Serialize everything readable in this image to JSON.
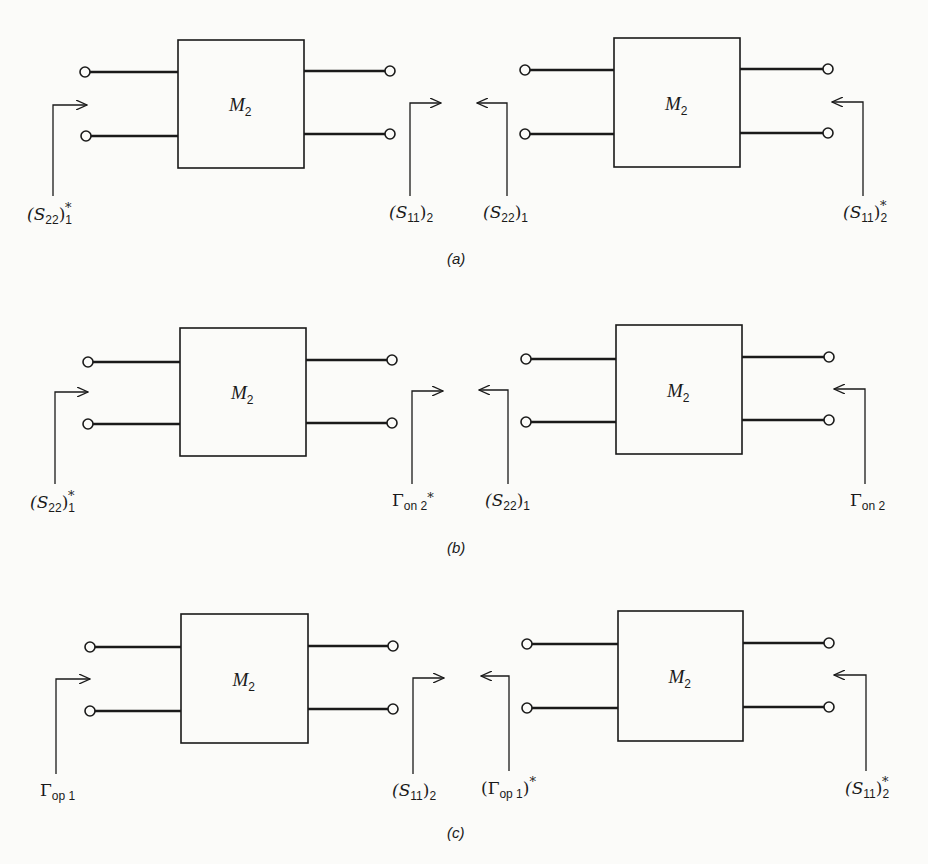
{
  "figure": {
    "panels": [
      {
        "id": "a",
        "caption": "(a)",
        "caption_pos": [
          447,
          264
        ],
        "networks": [
          {
            "block_label": "M",
            "block_sub": "2",
            "box": [
              178,
              40,
              126,
              128
            ],
            "left_terminals": [
              [
                85,
                72
              ],
              [
                86,
                136
              ]
            ],
            "right_terminals": [
              [
                390,
                71
              ],
              [
                390,
                134
              ]
            ],
            "arrow": {
              "vx": 53,
              "y_top": 105,
              "y_bot": 196,
              "tip_x": 87,
              "dir": "right"
            },
            "port_label": {
              "main": "(S",
              "sub": "22",
              "close": ")",
              "tail_sub": "1",
              "sup": "*",
              "x": 27,
              "y": 220
            }
          },
          {
            "block_label": "M",
            "block_sub": "2",
            "box": [
              614,
              38,
              126,
              129
            ],
            "left_terminals": [
              [
                525,
                70
              ],
              [
                525,
                134
              ]
            ],
            "right_terminals": [
              [
                828,
                69
              ],
              [
                828,
                133
              ]
            ],
            "arrow": {
              "vx": 507,
              "y_top": 103,
              "y_bot": 196,
              "tip_x": 477,
              "dir": "left"
            },
            "port_label": {
              "main": "(S",
              "sub": "22",
              "close": ")",
              "tail_sub": "1",
              "sup": "",
              "x": 483,
              "y": 218
            }
          }
        ],
        "mid_arrow": {
          "vx": 410,
          "y_top": 103,
          "y_bot": 196,
          "tip_x": 441,
          "dir": "right"
        },
        "mid_label": {
          "main": "(S",
          "sub": "11",
          "close": ")",
          "tail_sub": "2",
          "sup": "",
          "x": 389,
          "y": 218
        },
        "right_arrow": {
          "vx": 863,
          "y_top": 102,
          "y_bot": 196,
          "tip_x": 832,
          "dir": "left"
        },
        "right_label": {
          "main": "(S",
          "sub": "11",
          "close": ")",
          "tail_sub": "2",
          "sup": "*",
          "x": 843,
          "y": 218
        }
      },
      {
        "id": "b",
        "caption": "(b)",
        "caption_pos": [
          447,
          553
        ],
        "networks": [
          {
            "block_label": "M",
            "block_sub": "2",
            "box": [
              180,
              328,
              126,
              128
            ],
            "left_terminals": [
              [
                88,
                362
              ],
              [
                88,
                424
              ]
            ],
            "right_terminals": [
              [
                392,
                360
              ],
              [
                392,
                423
              ]
            ],
            "arrow": {
              "vx": 55,
              "y_top": 392,
              "y_bot": 484,
              "tip_x": 88,
              "dir": "right"
            },
            "port_label": {
              "main": "(S",
              "sub": "22",
              "close": ")",
              "tail_sub": "1",
              "sup": "*",
              "x": 30,
              "y": 508
            }
          },
          {
            "block_label": "M",
            "block_sub": "2",
            "box": [
              616,
              325,
              126,
              129
            ],
            "left_terminals": [
              [
                526,
                359
              ],
              [
                526,
                422
              ]
            ],
            "right_terminals": [
              [
                829,
                357
              ],
              [
                829,
                420
              ]
            ],
            "arrow": {
              "vx": 508,
              "y_top": 390,
              "y_bot": 484,
              "tip_x": 479,
              "dir": "left"
            },
            "port_label": {
              "main": "(S",
              "sub": "22",
              "close": ")",
              "tail_sub": "1",
              "sup": "",
              "x": 485,
              "y": 506
            }
          }
        ],
        "mid_arrow": {
          "vx": 412,
          "y_top": 391,
          "y_bot": 484,
          "tip_x": 443,
          "dir": "right"
        },
        "mid_label": {
          "main": "Γ",
          "sub": "on 2",
          "close": "",
          "tail_sub": "",
          "sup": "*",
          "x": 392,
          "y": 506
        },
        "right_arrow": {
          "vx": 865,
          "y_top": 389,
          "y_bot": 484,
          "tip_x": 834,
          "dir": "left"
        },
        "right_label": {
          "main": "Γ",
          "sub": "on 2",
          "close": "",
          "tail_sub": "",
          "sup": "",
          "x": 850,
          "y": 506
        }
      },
      {
        "id": "c",
        "caption": "(c)",
        "caption_pos": [
          447,
          838
        ],
        "networks": [
          {
            "block_label": "M",
            "block_sub": "2",
            "box": [
              181,
              614,
              127,
              129
            ],
            "left_terminals": [
              [
                90,
                647
              ],
              [
                90,
                711
              ]
            ],
            "right_terminals": [
              [
                393,
                646
              ],
              [
                393,
                709
              ]
            ],
            "arrow": {
              "vx": 56,
              "y_top": 679,
              "y_bot": 774,
              "tip_x": 90,
              "dir": "right"
            },
            "port_label": {
              "main": "Γ",
              "sub": "op 1",
              "close": "",
              "tail_sub": "",
              "sup": "",
              "x": 40,
              "y": 796
            }
          },
          {
            "block_label": "M",
            "block_sub": "2",
            "box": [
              618,
              611,
              125,
              130
            ],
            "left_terminals": [
              [
                527,
                644
              ],
              [
                527,
                708
              ]
            ],
            "right_terminals": [
              [
                829,
                643
              ],
              [
                829,
                707
              ]
            ],
            "arrow": {
              "vx": 509,
              "y_top": 676,
              "y_bot": 771,
              "tip_x": 481,
              "dir": "left"
            },
            "port_label": {
              "main": "(Γ",
              "sub": "op 1",
              "close": ")",
              "tail_sub": "",
              "sup": "*",
              "x": 481,
              "y": 794
            }
          }
        ],
        "mid_arrow": {
          "vx": 413,
          "y_top": 678,
          "y_bot": 774,
          "tip_x": 444,
          "dir": "right"
        },
        "mid_label": {
          "main": "(S",
          "sub": "11",
          "close": ")",
          "tail_sub": "2",
          "sup": "",
          "x": 392,
          "y": 796
        },
        "right_arrow": {
          "vx": 866,
          "y_top": 675,
          "y_bot": 771,
          "tip_x": 834,
          "dir": "left"
        },
        "right_label": {
          "main": "(S",
          "sub": "11",
          "close": ")",
          "tail_sub": "2",
          "sup": "*",
          "x": 845,
          "y": 794
        }
      }
    ]
  }
}
